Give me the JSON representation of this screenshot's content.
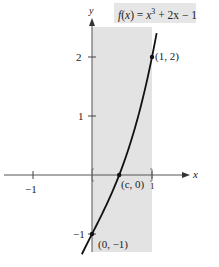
{
  "chart_data": {
    "type": "line",
    "title": "",
    "function_label": "f(x) = x^3 + 2x - 1",
    "function_label_parts": {
      "f": "f",
      "x_open": "(x) = ",
      "x": "x",
      "exp": "3",
      "rest": " + 2x − 1"
    },
    "xlabel": "x",
    "ylabel": "y",
    "xlim": [
      -1.5,
      1.5
    ],
    "ylim": [
      -1.3,
      2.5
    ],
    "x_ticks": [
      {
        "value": -1,
        "label": "−1"
      },
      {
        "value": 1,
        "label": "1"
      }
    ],
    "y_ticks": [
      {
        "value": 2,
        "label": "2"
      },
      {
        "value": 1,
        "label": "1"
      },
      {
        "value": -1,
        "label": "−1"
      }
    ],
    "grid": false,
    "shaded_interval": {
      "x_from": 0,
      "x_to": 1,
      "color": "#e3e3e3"
    },
    "series": [
      {
        "name": "f(x) = x^3 + 2x - 1",
        "x": [
          -0.25,
          0,
          0.2,
          0.4,
          0.4534,
          0.6,
          0.8,
          1,
          1.1
        ],
        "y": [
          -1.516,
          -1,
          -0.592,
          -0.136,
          0,
          0.416,
          1.112,
          2,
          2.531
        ],
        "color": "#111111"
      }
    ],
    "annotations": [
      {
        "point": [
          1,
          2
        ],
        "label": "(1, 2)"
      },
      {
        "point": [
          0.4534,
          0
        ],
        "label": "(c, 0)"
      },
      {
        "point": [
          0,
          -1
        ],
        "label": "(0, −1)"
      }
    ]
  },
  "labels": {
    "y_axis": "y",
    "x_axis": "x",
    "tick_y_2": "2",
    "tick_y_1": "1",
    "tick_y_neg1": "−1",
    "tick_x_neg1": "−1",
    "tick_x_1": "1",
    "point_1_2": "(1, 2)",
    "point_c_0": "(c, 0)",
    "point_0_neg1": "(0, −1)"
  }
}
